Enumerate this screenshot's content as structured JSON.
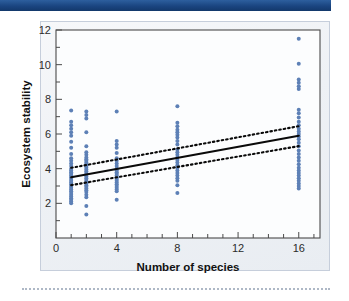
{
  "header": {
    "bar_color": "#1f4e8c"
  },
  "figure": {
    "background_color": "#f2f4f7",
    "border_color": "#c6cedb"
  },
  "chart_data": {
    "type": "scatter",
    "title": "",
    "subtitle": "",
    "xlabel": "Number of species",
    "ylabel": "Ecosystem stability",
    "xlim": [
      0,
      17.4
    ],
    "ylim": [
      0,
      12
    ],
    "xticks": [
      0,
      4,
      8,
      12,
      16
    ],
    "xticklabels": [
      "0",
      "4",
      "8",
      "12",
      "16"
    ],
    "xminorticks": [
      1,
      2,
      3,
      5,
      6,
      7,
      9,
      10,
      11,
      13,
      14,
      15,
      17
    ],
    "yticks": [
      2,
      4,
      6,
      8,
      10,
      12
    ],
    "yticklabels": [
      "2",
      "4",
      "6",
      "8",
      "10",
      "12"
    ],
    "yminorticks": [
      1,
      3,
      5,
      7,
      9,
      11
    ],
    "grid": false,
    "legend": false,
    "legend_position": "none",
    "point_color": "#5d80b6",
    "point_radius": 2.0,
    "series": [
      {
        "name": "observations",
        "marker": "circle",
        "color": "#5d80b6",
        "points": [
          [
            1,
            7.35
          ],
          [
            1,
            6.7
          ],
          [
            1,
            6.5
          ],
          [
            1,
            6.3
          ],
          [
            1,
            6.1
          ],
          [
            1,
            5.9
          ],
          [
            1,
            5.55
          ],
          [
            1,
            5.2
          ],
          [
            1,
            4.85
          ],
          [
            1,
            4.6
          ],
          [
            1,
            4.45
          ],
          [
            1,
            4.3
          ],
          [
            1,
            4.15
          ],
          [
            1,
            4.0
          ],
          [
            1,
            3.9
          ],
          [
            1,
            3.8
          ],
          [
            1,
            3.7
          ],
          [
            1,
            3.6
          ],
          [
            1,
            3.5
          ],
          [
            1,
            3.4
          ],
          [
            1,
            3.3
          ],
          [
            1,
            3.2
          ],
          [
            1,
            3.1
          ],
          [
            1,
            3.0
          ],
          [
            1,
            2.9
          ],
          [
            1,
            2.8
          ],
          [
            1,
            2.7
          ],
          [
            1,
            2.6
          ],
          [
            1,
            2.5
          ],
          [
            1,
            2.4
          ],
          [
            1,
            2.3
          ],
          [
            1,
            2.2
          ],
          [
            1,
            2.1
          ],
          [
            1,
            2.0
          ],
          [
            2,
            7.3
          ],
          [
            2,
            7.1
          ],
          [
            2,
            6.9
          ],
          [
            2,
            6.1
          ],
          [
            2,
            5.3
          ],
          [
            2,
            4.95
          ],
          [
            2,
            4.8
          ],
          [
            2,
            4.65
          ],
          [
            2,
            4.55
          ],
          [
            2,
            4.45
          ],
          [
            2,
            4.35
          ],
          [
            2,
            4.25
          ],
          [
            2,
            4.15
          ],
          [
            2,
            4.05
          ],
          [
            2,
            3.95
          ],
          [
            2,
            3.85
          ],
          [
            2,
            3.75
          ],
          [
            2,
            3.65
          ],
          [
            2,
            3.55
          ],
          [
            2,
            3.45
          ],
          [
            2,
            3.35
          ],
          [
            2,
            3.25
          ],
          [
            2,
            3.15
          ],
          [
            2,
            3.05
          ],
          [
            2,
            2.95
          ],
          [
            2,
            2.85
          ],
          [
            2,
            2.75
          ],
          [
            2,
            2.65
          ],
          [
            2,
            2.5
          ],
          [
            2,
            2.35
          ],
          [
            2,
            1.85
          ],
          [
            2,
            1.35
          ],
          [
            4,
            7.3
          ],
          [
            4,
            5.6
          ],
          [
            4,
            5.4
          ],
          [
            4,
            5.2
          ],
          [
            4,
            4.9
          ],
          [
            4,
            4.6
          ],
          [
            4,
            4.45
          ],
          [
            4,
            4.3
          ],
          [
            4,
            4.15
          ],
          [
            4,
            4.0
          ],
          [
            4,
            3.9
          ],
          [
            4,
            3.8
          ],
          [
            4,
            3.7
          ],
          [
            4,
            3.6
          ],
          [
            4,
            3.5
          ],
          [
            4,
            3.4
          ],
          [
            4,
            3.3
          ],
          [
            4,
            3.2
          ],
          [
            4,
            3.1
          ],
          [
            4,
            3.0
          ],
          [
            4,
            2.9
          ],
          [
            4,
            2.8
          ],
          [
            4,
            2.7
          ],
          [
            4,
            2.2
          ],
          [
            8,
            7.6
          ],
          [
            8,
            6.65
          ],
          [
            8,
            6.45
          ],
          [
            8,
            6.25
          ],
          [
            8,
            6.1
          ],
          [
            8,
            5.95
          ],
          [
            8,
            5.8
          ],
          [
            8,
            5.6
          ],
          [
            8,
            5.4
          ],
          [
            8,
            5.1
          ],
          [
            8,
            4.95
          ],
          [
            8,
            4.8
          ],
          [
            8,
            4.65
          ],
          [
            8,
            4.5
          ],
          [
            8,
            4.35
          ],
          [
            8,
            4.2
          ],
          [
            8,
            4.05
          ],
          [
            8,
            3.9
          ],
          [
            8,
            3.75
          ],
          [
            8,
            3.6
          ],
          [
            8,
            3.45
          ],
          [
            8,
            3.3
          ],
          [
            8,
            3.05
          ],
          [
            8,
            2.6
          ],
          [
            16,
            11.5
          ],
          [
            16,
            10.05
          ],
          [
            16,
            9.15
          ],
          [
            16,
            8.95
          ],
          [
            16,
            8.75
          ],
          [
            16,
            8.6
          ],
          [
            16,
            7.4
          ],
          [
            16,
            7.2
          ],
          [
            16,
            6.95
          ],
          [
            16,
            6.7
          ],
          [
            16,
            6.5
          ],
          [
            16,
            6.3
          ],
          [
            16,
            6.15
          ],
          [
            16,
            6.0
          ],
          [
            16,
            5.85
          ],
          [
            16,
            5.7
          ],
          [
            16,
            5.5
          ],
          [
            16,
            5.3
          ],
          [
            16,
            5.05
          ],
          [
            16,
            4.85
          ],
          [
            16,
            4.65
          ],
          [
            16,
            4.45
          ],
          [
            16,
            4.25
          ],
          [
            16,
            4.05
          ],
          [
            16,
            3.9
          ],
          [
            16,
            3.75
          ],
          [
            16,
            3.6
          ],
          [
            16,
            3.45
          ],
          [
            16,
            3.3
          ],
          [
            16,
            3.15
          ],
          [
            16,
            3.0
          ],
          [
            16,
            2.85
          ]
        ]
      }
    ],
    "fit_line": {
      "name": "regression-line",
      "style": "solid",
      "color": "#0a0a0a",
      "x": [
        1,
        16
      ],
      "y": [
        3.5,
        5.9
      ]
    },
    "confidence_bands": [
      {
        "name": "upper-confidence-band",
        "style": "dotted",
        "color": "#0a0a0a",
        "x": [
          1,
          16
        ],
        "y": [
          4.05,
          6.45
        ]
      },
      {
        "name": "lower-confidence-band",
        "style": "dotted",
        "color": "#0a0a0a",
        "x": [
          1,
          16
        ],
        "y": [
          3.05,
          5.3
        ]
      }
    ]
  }
}
